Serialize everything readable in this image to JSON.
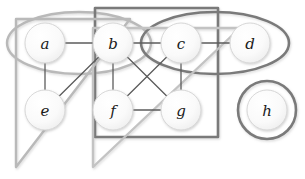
{
  "figure": {
    "width": 305,
    "height": 179,
    "background": "#ffffff",
    "type": "graph-diagram-with-cluster-overlays"
  },
  "palette": {
    "node_fill": "#fbfbfb",
    "node_fill_center": "#ffffff",
    "node_stroke": "#d8d8d8",
    "node_text": "#1a1a1a",
    "edge_stroke": "#5c5c5c",
    "overlay_dark": "#7a7a7a",
    "overlay_light": "#b9b9b9",
    "shadow": "#cfcfcf"
  },
  "nodes": [
    {
      "id": "a",
      "label": "a",
      "cx": 45,
      "cy": 43,
      "r": 20
    },
    {
      "id": "b",
      "label": "b",
      "cx": 113,
      "cy": 43,
      "r": 20
    },
    {
      "id": "c",
      "label": "c",
      "cx": 181,
      "cy": 43,
      "r": 20
    },
    {
      "id": "d",
      "label": "d",
      "cx": 250,
      "cy": 43,
      "r": 20
    },
    {
      "id": "e",
      "label": "e",
      "cx": 45,
      "cy": 110,
      "r": 20
    },
    {
      "id": "f",
      "label": "f",
      "cx": 113,
      "cy": 110,
      "r": 20
    },
    {
      "id": "g",
      "label": "g",
      "cx": 181,
      "cy": 110,
      "r": 20
    },
    {
      "id": "h",
      "label": "h",
      "cx": 267,
      "cy": 110,
      "r": 20
    }
  ],
  "edges": [
    {
      "id": "a-b",
      "source": "a",
      "target": "b"
    },
    {
      "id": "b-c",
      "source": "b",
      "target": "c"
    },
    {
      "id": "c-d",
      "source": "c",
      "target": "d"
    },
    {
      "id": "a-e",
      "source": "a",
      "target": "e"
    },
    {
      "id": "b-e",
      "source": "b",
      "target": "e"
    },
    {
      "id": "b-f",
      "source": "b",
      "target": "f"
    },
    {
      "id": "b-g",
      "source": "b",
      "target": "g"
    },
    {
      "id": "c-f",
      "source": "c",
      "target": "f"
    },
    {
      "id": "c-g",
      "source": "c",
      "target": "g"
    },
    {
      "id": "f-g",
      "source": "f",
      "target": "g"
    }
  ],
  "overlays": [
    {
      "id": "ellipse-ab",
      "shape": "ellipse",
      "members": [
        "a",
        "b"
      ],
      "cx": 79,
      "cy": 43,
      "rx": 72,
      "ry": 31,
      "stroke": "#b9b9b9",
      "stroke_width": 2.4
    },
    {
      "id": "ellipse-cd",
      "shape": "ellipse",
      "members": [
        "c",
        "d"
      ],
      "cx": 215,
      "cy": 43,
      "rx": 74,
      "ry": 31,
      "stroke": "#7a7a7a",
      "stroke_width": 2.6
    },
    {
      "id": "circle-h",
      "shape": "circle",
      "members": [
        "h"
      ],
      "cx": 267,
      "cy": 110,
      "r": 29,
      "stroke": "#7a7a7a",
      "stroke_width": 2.6
    },
    {
      "id": "rect-bcfg",
      "shape": "rectangle",
      "members": [
        "b",
        "c",
        "f",
        "g"
      ],
      "x": 95,
      "y": 8,
      "width": 123,
      "height": 129,
      "stroke": "#7a7a7a",
      "stroke_width": 2.6
    },
    {
      "id": "triangle-abe",
      "shape": "triangle",
      "members": [
        "a",
        "b",
        "e"
      ],
      "points": "16,19 130,19 16,167",
      "stroke": "#b9b9b9",
      "stroke_width": 2.4
    },
    {
      "id": "triangle-bcdfg",
      "shape": "triangle",
      "members": [
        "b",
        "c",
        "d",
        "f",
        "g"
      ],
      "points": "93,28 240,28 93,167",
      "stroke": "#c3c3c3",
      "stroke_width": 2.4
    }
  ]
}
